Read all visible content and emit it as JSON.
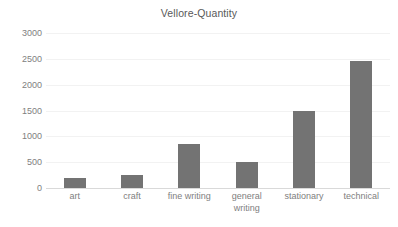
{
  "chart_data": {
    "type": "bar",
    "title": "Vellore-Quantity",
    "xlabel": "",
    "ylabel": "",
    "categories": [
      "art",
      "craft",
      "fine writing",
      "general writing",
      "stationary",
      "technical"
    ],
    "values": [
      200,
      250,
      850,
      500,
      1500,
      2450
    ],
    "ylim": [
      0,
      3000
    ],
    "yticks": [
      0,
      500,
      1000,
      1500,
      2000,
      2500,
      3000
    ],
    "ytick_labels": [
      "0",
      "500",
      "1000",
      "1500",
      "2000",
      "2500",
      "3000"
    ],
    "grid": true,
    "legend": false,
    "series": [
      {
        "name": "Quantity",
        "values": [
          200,
          250,
          850,
          500,
          1500,
          2450
        ]
      }
    ],
    "colors": {
      "bar": "#737373",
      "gridline": "#f2f2f2",
      "axis": "#d9d9d9",
      "text": "#808080",
      "title_text": "#595959",
      "background": "#ffffff"
    },
    "category_label_lines": [
      [
        "art"
      ],
      [
        "craft"
      ],
      [
        "fine writing"
      ],
      [
        "general",
        "writing"
      ],
      [
        "stationary"
      ],
      [
        "technical"
      ]
    ]
  }
}
